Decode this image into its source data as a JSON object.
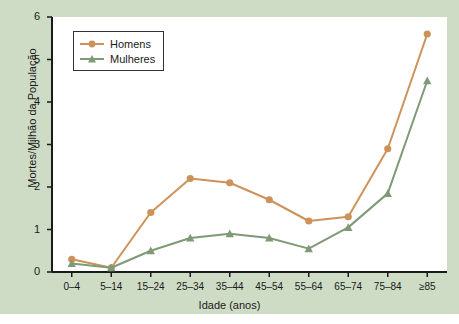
{
  "chart_data": {
    "type": "line",
    "title": "",
    "subtitle": "",
    "xlabel": "Idade (anos)",
    "ylabel": "Mortes/Milhão da População",
    "categories": [
      "0–4",
      "5–14",
      "15–24",
      "25–34",
      "35–44",
      "45–54",
      "55–64",
      "65–74",
      "75–84",
      "≥85"
    ],
    "ylim": [
      0,
      6
    ],
    "yticks": [
      0,
      1,
      2,
      3,
      4,
      5,
      6
    ],
    "ytick_labels": [
      "0",
      "1",
      "2",
      "3",
      "4",
      "5",
      "6"
    ],
    "grid": false,
    "legend_position": "top-left",
    "series": [
      {
        "name": "Homens",
        "color": "#cd9259",
        "marker": "circle",
        "values": [
          0.3,
          0.1,
          1.4,
          2.2,
          2.1,
          1.7,
          1.2,
          1.3,
          2.9,
          5.6
        ]
      },
      {
        "name": "Mulheres",
        "color": "#7e9a76",
        "marker": "triangle",
        "values": [
          0.2,
          0.1,
          0.5,
          0.8,
          0.9,
          0.8,
          0.55,
          1.05,
          1.85,
          4.5
        ]
      }
    ]
  },
  "legend": {
    "entries": [
      {
        "label": "Homens"
      },
      {
        "label": "Mulheres"
      }
    ]
  },
  "colors": {
    "background": "#cfdcc5",
    "plot_background": "#ffffff",
    "axis": "#1a1a1a",
    "series_homens": "#cd9259",
    "series_mulheres": "#7e9a76"
  }
}
